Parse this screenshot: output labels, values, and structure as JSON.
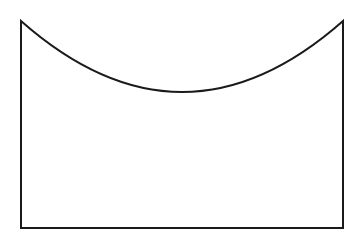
{
  "diagram": {
    "stroke_color": "#1a1a1a",
    "background": "#ffffff",
    "stroke_width": 2,
    "points": {
      "top_left": [
        21,
        21
      ],
      "top_right": [
        343,
        21
      ],
      "bottom_right": [
        343,
        228
      ],
      "bottom_left": [
        21,
        228
      ],
      "curve_lowest": [
        182,
        92
      ]
    }
  }
}
